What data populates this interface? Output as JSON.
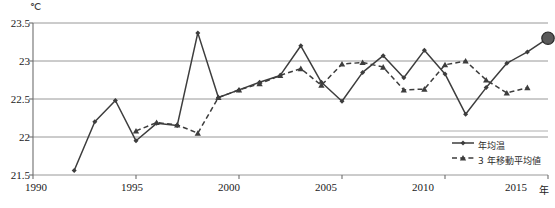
{
  "axes": {
    "y_unit": "℃",
    "y_ticks": [
      "23.5",
      "23",
      "22.5",
      "22",
      "21.5"
    ],
    "x_ticks": [
      "1990",
      "1995",
      "2000",
      "2005",
      "2010",
      "2015"
    ],
    "x_unit": "年"
  },
  "legend": {
    "items": [
      {
        "label": "年均温",
        "style": "solid-diamond",
        "color": "#3d3d3d"
      },
      {
        "label": "3 年移動平均値",
        "style": "dashed-triangle",
        "color": "#3d3d3d"
      }
    ]
  },
  "caption": "",
  "chart_data": {
    "type": "line",
    "title": "",
    "xlabel": "年",
    "ylabel": "℃",
    "xlim": [
      1990,
      2015
    ],
    "ylim": [
      21.5,
      23.5
    ],
    "grid": true,
    "legend_position": "bottom-right",
    "series": [
      {
        "name": "年均温",
        "style": "solid",
        "marker": "diamond",
        "x": [
          1992,
          1993,
          1994,
          1995,
          1996,
          1997,
          1998,
          1999,
          2000,
          2001,
          2002,
          2003,
          2004,
          2005,
          2006,
          2007,
          2008,
          2009,
          2010,
          2011,
          2012,
          2013,
          2014,
          2015
        ],
        "values": [
          21.56,
          22.2,
          22.48,
          21.95,
          22.18,
          22.15,
          23.37,
          22.52,
          22.62,
          22.72,
          22.81,
          23.2,
          22.72,
          22.47,
          22.85,
          23.07,
          22.78,
          23.14,
          22.83,
          22.3,
          22.65,
          22.97,
          23.12,
          23.3
        ]
      },
      {
        "name": "3 年移動平均値",
        "style": "dashed",
        "marker": "triangle",
        "x": [
          1995,
          1996,
          1997,
          1998,
          1999,
          2000,
          2001,
          2002,
          2003,
          2004,
          2005,
          2006,
          2007,
          2008,
          2009,
          2010,
          2011,
          2012,
          2013,
          2014
        ],
        "values": [
          22.08,
          22.19,
          22.16,
          22.05,
          22.52,
          22.62,
          22.7,
          22.81,
          22.9,
          22.68,
          22.96,
          22.98,
          22.92,
          22.62,
          22.63,
          22.95,
          23.0,
          22.75,
          22.58,
          22.65
        ]
      }
    ],
    "highlight_point": {
      "x": 2015,
      "y": 23.3,
      "marker": "large-filled-circle"
    }
  }
}
